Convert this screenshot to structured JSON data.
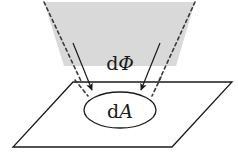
{
  "figure": {
    "background_color": "#ffffff",
    "width": 238,
    "height": 156
  },
  "labels": {
    "flux": {
      "d": "d",
      "symbol": "Φ",
      "full": "dΦ",
      "x": 120,
      "y": 70
    },
    "area": {
      "d": "d",
      "symbol": "A",
      "full": "dA",
      "x": 120,
      "y": 120
    }
  },
  "shapes": {
    "beam": {
      "name": "light-beam-trapezoid",
      "fill_color": "#d9d9d9",
      "stroke_color": "#2b2b2b",
      "points": "44,2 195,2 176,66 64,66",
      "edge_style": "dashed"
    },
    "plane": {
      "name": "surface-plane-parallelogram",
      "fill_color": "#ffffff",
      "stroke_color": "#1a1a1a",
      "points": "73,82 232,82 172,147 13,147"
    },
    "area_ellipse": {
      "name": "area-element-ellipse",
      "fill_color": "#ffffff",
      "stroke_color": "#1a1a1a",
      "cx": 120,
      "cy": 110,
      "rx": 36,
      "ry": 18
    },
    "dashed_left": {
      "name": "beam-edge-left-dashed",
      "x1": 44,
      "y1": 2,
      "x2": 88,
      "y2": 96
    },
    "dashed_right": {
      "name": "beam-edge-right-dashed",
      "x1": 195,
      "y1": 2,
      "x2": 152,
      "y2": 96
    },
    "arrow_left": {
      "name": "flux-arrow-left",
      "x1": 73,
      "y1": 43,
      "x2": 93,
      "y2": 92,
      "color": "#1a1a1a"
    },
    "arrow_right": {
      "name": "flux-arrow-right",
      "x1": 160,
      "y1": 43,
      "x2": 140,
      "y2": 92,
      "color": "#1a1a1a"
    }
  },
  "colors": {
    "beam_gray": "#d9d9d9",
    "line_black": "#1a1a1a",
    "dash_gray": "#3a3a3a",
    "background": "#ffffff"
  }
}
